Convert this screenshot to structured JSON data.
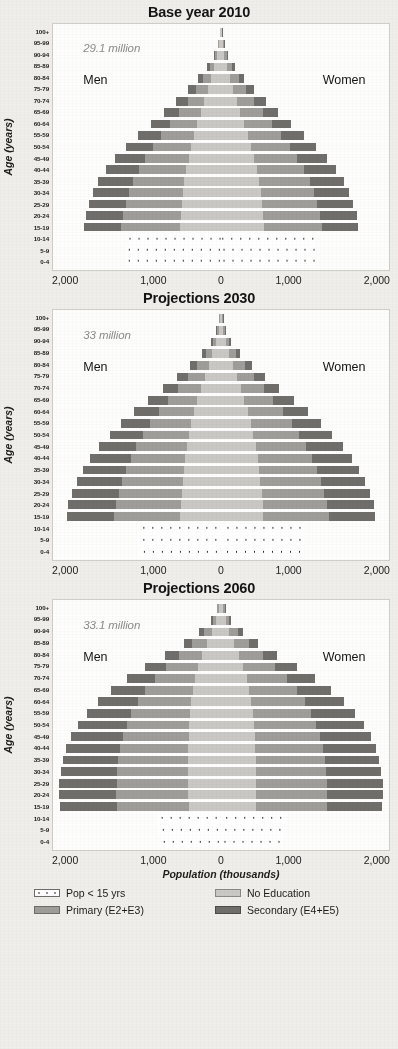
{
  "axis": {
    "y_title": "Age (years)",
    "x_title": "Population (thousands)",
    "x_ticks": [
      "2,000",
      "1,000",
      "0",
      "1,000",
      "2,000"
    ],
    "age_groups": [
      "100+",
      "95-99",
      "90-94",
      "85-89",
      "80-84",
      "75-79",
      "70-74",
      "65-69",
      "60-64",
      "55-59",
      "50-54",
      "45-49",
      "40-44",
      "35-39",
      "30-34",
      "25-29",
      "20-24",
      "15-19",
      "10-14",
      "5-9",
      "0-4"
    ]
  },
  "labels": {
    "men": "Men",
    "women": "Women"
  },
  "legend": {
    "items": [
      {
        "label": "Pop < 15 yrs",
        "swatch": "dots",
        "color": "#ffffff"
      },
      {
        "label": "No Education",
        "swatch": "noedu",
        "color": "#c9c8c4"
      },
      {
        "label": "Primary (E2+E3)",
        "swatch": "primary",
        "color": "#9e9d99"
      },
      {
        "label": "Secondary (E4+E5)",
        "swatch": "secondary",
        "color": "#6f6e6b"
      }
    ]
  },
  "panels": [
    {
      "title": "Base year 2010",
      "total": "29.1 million"
    },
    {
      "title": "Projections 2030",
      "total": "33 million"
    },
    {
      "title": "Projections 2060",
      "total": "33.1 million"
    }
  ],
  "chart_data": {
    "type": "bar",
    "subtype": "population-pyramid",
    "xlabel": "Population (thousands)",
    "ylabel": "Age (years)",
    "xlim": [
      -2000,
      2000
    ],
    "x_ticks": [
      -2000,
      -1000,
      0,
      1000,
      2000
    ],
    "tick_labels": [
      "2,000",
      "1,000",
      "0",
      "1,000",
      "2,000"
    ],
    "grid": false,
    "legend_position": "bottom",
    "categories": [
      "100+",
      "95-99",
      "90-94",
      "85-89",
      "80-84",
      "75-79",
      "70-74",
      "65-69",
      "60-64",
      "55-59",
      "50-54",
      "45-49",
      "40-44",
      "35-39",
      "30-34",
      "25-29",
      "20-24",
      "15-19",
      "10-14",
      "5-9",
      "0-4"
    ],
    "education_levels": [
      "No Education",
      "Primary (E2+E3)",
      "Secondary (E4+E5)"
    ],
    "under15_label": "Pop < 15 yrs",
    "panels": [
      {
        "title": "Base year 2010",
        "total_label": "29.1 million",
        "total_thousands": 29100,
        "under15_rows": [
          "10-14",
          "5-9",
          "0-4"
        ],
        "under15": {
          "men": [
            1120,
            1150,
            1150
          ],
          "women": [
            1090,
            1120,
            1120
          ]
        },
        "men": {
          "No Education": [
            8,
            16,
            34,
            60,
            92,
            124,
            160,
            196,
            232,
            268,
            300,
            330,
            356,
            380,
            396,
            408,
            420,
            430,
            null,
            null,
            null
          ],
          "Primary (E2+E3)": [
            4,
            10,
            24,
            48,
            84,
            124,
            170,
            222,
            278,
            334,
            388,
            436,
            478,
            512,
            540,
            560,
            578,
            588,
            null,
            null,
            null
          ],
          "Secondary (E4+E5)": [
            2,
            6,
            14,
            28,
            52,
            80,
            112,
            148,
            186,
            226,
            264,
            300,
            330,
            352,
            366,
            374,
            378,
            378,
            null,
            null,
            null
          ]
        },
        "women": {
          "No Education": [
            9,
            18,
            38,
            66,
            98,
            130,
            166,
            202,
            238,
            272,
            302,
            330,
            354,
            376,
            390,
            402,
            412,
            420,
            null,
            null,
            null
          ],
          "Primary (E2+E3)": [
            4,
            11,
            26,
            52,
            88,
            128,
            174,
            226,
            280,
            334,
            386,
            432,
            472,
            506,
            532,
            552,
            568,
            578,
            null,
            null,
            null
          ],
          "Secondary (E4+E5)": [
            2,
            6,
            15,
            30,
            54,
            82,
            114,
            150,
            188,
            226,
            262,
            296,
            324,
            344,
            358,
            364,
            368,
            368,
            null,
            null,
            null
          ]
        }
      },
      {
        "title": "Projections 2030",
        "total_label": "33 million",
        "total_thousands": 33000,
        "under15_rows": [
          "10-14",
          "5-9",
          "0-4"
        ],
        "under15": {
          "men": [
            1020,
            1020,
            1010
          ],
          "women": [
            975,
            975,
            965
          ]
        },
        "men": {
          "No Education": [
            10,
            22,
            46,
            80,
            118,
            158,
            196,
            232,
            266,
            296,
            322,
            344,
            362,
            378,
            390,
            400,
            412,
            418,
            null,
            null,
            null
          ],
          "Primary (E2+E3)": [
            5,
            14,
            34,
            68,
            116,
            170,
            228,
            290,
            352,
            410,
            462,
            508,
            548,
            582,
            610,
            634,
            656,
            664,
            null,
            null,
            null
          ],
          "Secondary (E4+E5)": [
            3,
            8,
            20,
            40,
            72,
            110,
            154,
            200,
            248,
            294,
            336,
            374,
            406,
            432,
            452,
            466,
            476,
            478,
            null,
            null,
            null
          ]
        },
        "women": {
          "No Education": [
            12,
            26,
            52,
            88,
            126,
            166,
            204,
            240,
            272,
            300,
            324,
            346,
            364,
            378,
            390,
            400,
            410,
            416,
            null,
            null,
            null
          ],
          "Primary (E2+E3)": [
            5,
            15,
            36,
            72,
            120,
            174,
            232,
            294,
            354,
            412,
            462,
            506,
            546,
            580,
            608,
            630,
            650,
            658,
            null,
            null,
            null
          ],
          "Secondary (E4+E5)": [
            3,
            8,
            21,
            42,
            74,
            112,
            156,
            202,
            250,
            294,
            334,
            370,
            400,
            424,
            442,
            456,
            464,
            466,
            null,
            null,
            null
          ]
        }
      },
      {
        "title": "Projections 2060",
        "total_label": "33.1 million",
        "total_thousands": 33100,
        "under15_rows": [
          "10-14",
          "5-9",
          "0-4"
        ],
        "under15": {
          "men": [
            790,
            770,
            745
          ],
          "women": [
            755,
            735,
            715
          ]
        },
        "men": {
          "No Education": [
            20,
            44,
            84,
            132,
            180,
            222,
            256,
            282,
            302,
            316,
            326,
            332,
            336,
            338,
            340,
            340,
            340,
            338,
            null,
            null,
            null
          ],
          "Primary (E2+E3)": [
            14,
            36,
            80,
            148,
            232,
            320,
            404,
            476,
            538,
            588,
            628,
            660,
            684,
            702,
            714,
            722,
            726,
            724,
            null,
            null,
            null
          ],
          "Secondary (E4+E5)": [
            8,
            20,
            46,
            88,
            146,
            212,
            280,
            344,
            400,
            448,
            488,
            520,
            544,
            560,
            570,
            574,
            574,
            570,
            null,
            null,
            null
          ]
        },
        "women": {
          "No Education": [
            24,
            50,
            92,
            142,
            190,
            230,
            262,
            286,
            304,
            318,
            326,
            332,
            336,
            338,
            338,
            338,
            338,
            336,
            null,
            null,
            null
          ],
          "Primary (E2+E3)": [
            15,
            38,
            84,
            152,
            236,
            324,
            406,
            478,
            538,
            586,
            624,
            656,
            678,
            696,
            708,
            714,
            718,
            716,
            null,
            null,
            null
          ],
          "Secondary (E4+E5)": [
            8,
            21,
            48,
            90,
            148,
            214,
            280,
            342,
            396,
            442,
            480,
            510,
            532,
            548,
            556,
            560,
            560,
            556,
            null,
            null,
            null
          ]
        }
      }
    ]
  }
}
